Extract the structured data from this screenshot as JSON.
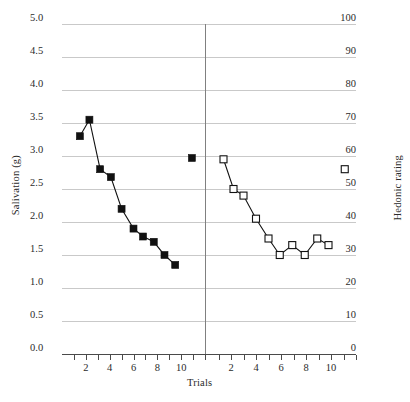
{
  "chart_data": {
    "type": "line",
    "title": "",
    "xlabel": "Trials",
    "panels": [
      {
        "name": "salivation-panel",
        "ylabel": "Salivation (g)",
        "ylim": [
          0.0,
          5.0
        ],
        "ytick_labels": [
          "5.0",
          "4.5",
          "4.0",
          "3.5",
          "3.0",
          "2.5",
          "2.0",
          "1.5",
          "1.0",
          "0.5",
          "0.0"
        ],
        "ytick_values": [
          5.0,
          4.5,
          4.0,
          3.5,
          3.0,
          2.5,
          2.0,
          1.5,
          1.0,
          0.5,
          0.0
        ],
        "xlim": [
          0,
          12
        ],
        "xtick_labels": [
          "2",
          "4",
          "6",
          "8",
          "10"
        ],
        "xtick_values": [
          2,
          4,
          6,
          8,
          10
        ],
        "minor_xticks": [
          1,
          2,
          3,
          4,
          5,
          6,
          7,
          8,
          9,
          10,
          11,
          12
        ],
        "marker": "filled-square",
        "series": [
          {
            "name": "salivation-acquisition",
            "connected": true,
            "x": [
              1.5,
              2.3,
              3.2,
              4.1,
              5.0,
              6.0,
              6.8,
              7.7,
              8.6,
              9.5
            ],
            "y": [
              3.3,
              3.55,
              2.8,
              2.68,
              2.2,
              1.9,
              1.78,
              1.7,
              1.5,
              1.35
            ]
          },
          {
            "name": "salivation-isolated-test",
            "connected": false,
            "x": [
              10.9
            ],
            "y": [
              2.97
            ]
          }
        ]
      },
      {
        "name": "hedonic-panel",
        "ylabel": "Hedonic rating",
        "ylim": [
          0,
          100
        ],
        "ytick_labels": [
          "100",
          "90",
          "80",
          "70",
          "60",
          "50",
          "40",
          "30",
          "20",
          "10",
          "0"
        ],
        "ytick_values": [
          100,
          90,
          80,
          70,
          60,
          50,
          40,
          30,
          20,
          10,
          0
        ],
        "xlim": [
          0,
          12
        ],
        "xtick_labels": [
          "2",
          "4",
          "6",
          "8",
          "10"
        ],
        "xtick_values": [
          2,
          4,
          6,
          8,
          10
        ],
        "minor_xticks": [
          1,
          2,
          3,
          4,
          5,
          6,
          7,
          8,
          9,
          10,
          11,
          12
        ],
        "marker": "open-square",
        "series": [
          {
            "name": "hedonic-acquisition",
            "connected": true,
            "x": [
              1.4,
              2.2,
              3.0,
              4.0,
              5.0,
              5.9,
              6.9,
              7.9,
              8.9,
              9.8
            ],
            "y": [
              59,
              50,
              48,
              41,
              35,
              30,
              33,
              30,
              35,
              33
            ]
          },
          {
            "name": "hedonic-isolated-test",
            "connected": false,
            "x": [
              11.1
            ],
            "y": [
              56
            ]
          }
        ]
      }
    ],
    "grid": true,
    "legend": "none",
    "colors": {
      "marker_fill": "#111111",
      "marker_open_fill": "#ffffff",
      "line": "#111111",
      "gridline": "#c9c9c9",
      "axis": "#4a4a4a",
      "divider": "#808080",
      "text": "#2b2b2b",
      "background": "#ffffff"
    }
  }
}
